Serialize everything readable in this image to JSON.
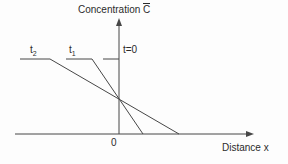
{
  "labels": {
    "y_axis_title": {
      "text": "Concentration",
      "symbol": "C"
    },
    "x_axis_title": "Distance x",
    "origin": "0",
    "curves": {
      "t0": "t=0",
      "t1": {
        "base": "t",
        "sub": "1"
      },
      "t2": {
        "base": "t",
        "sub": "2"
      }
    }
  },
  "diagram": {
    "background": "#fdfdfd",
    "stroke": "#474747",
    "lines": [
      {
        "name": "y-axis",
        "arrow": true,
        "points": [
          [
            119,
            134
          ],
          [
            119,
            21
          ]
        ]
      },
      {
        "name": "x-axis",
        "arrow": true,
        "points": [
          [
            15,
            134
          ],
          [
            251,
            134
          ]
        ]
      },
      {
        "name": "t0-profile",
        "arrow": false,
        "points": [
          [
            103,
            59
          ],
          [
            119,
            59
          ]
        ]
      },
      {
        "name": "t1-profile",
        "arrow": false,
        "points": [
          [
            66,
            59
          ],
          [
            92,
            59
          ],
          [
            143,
            134
          ]
        ]
      },
      {
        "name": "t2-profile",
        "arrow": false,
        "points": [
          [
            20,
            59
          ],
          [
            50,
            59
          ],
          [
            179,
            134
          ]
        ]
      }
    ]
  }
}
